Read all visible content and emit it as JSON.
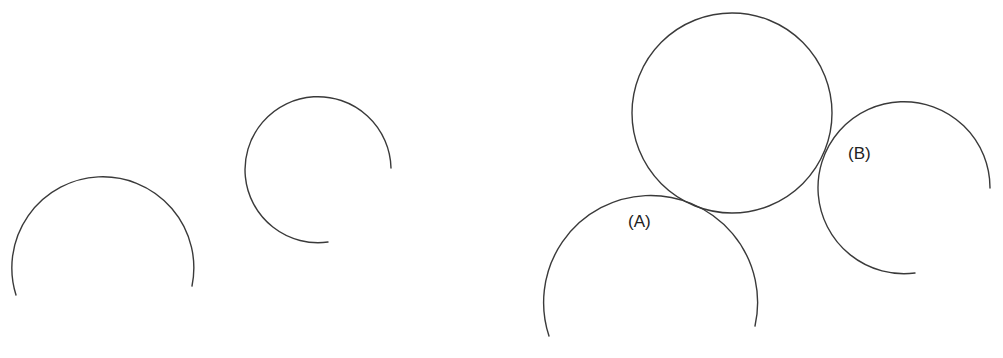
{
  "diagram": {
    "stroke_color": "#3a3a3a",
    "background": "#ffffff",
    "shapes": [
      {
        "id": "arc-1",
        "type": "arc",
        "center": [
          102,
          266
        ],
        "radius": 91,
        "start": [
          16,
          295
        ],
        "end": [
          192,
          286
        ],
        "sweep": "clockwise-over-top"
      },
      {
        "id": "arc-2",
        "type": "arc",
        "center": [
          318,
          170
        ],
        "radius": 73,
        "start": [
          328,
          242
        ],
        "end": [
          393,
          168
        ],
        "sweep": "clockwise"
      },
      {
        "id": "circle-top",
        "type": "circle",
        "center": [
          732,
          113
        ],
        "radius": 100
      },
      {
        "id": "arc-a",
        "type": "arc",
        "center": [
          650,
          300
        ],
        "radius": 107,
        "start": [
          549,
          336
        ],
        "end": [
          755,
          326
        ],
        "sweep": "clockwise-over-top"
      },
      {
        "id": "arc-b",
        "type": "arc",
        "center": [
          904,
          188
        ],
        "radius": 86,
        "start": [
          915,
          273
        ],
        "end": [
          990,
          188
        ],
        "sweep": "clockwise"
      }
    ],
    "labels": [
      {
        "id": "label-a",
        "text": "(A)",
        "x": 628,
        "y": 213
      },
      {
        "id": "label-b",
        "text": "(B)",
        "x": 848,
        "y": 145
      }
    ]
  }
}
